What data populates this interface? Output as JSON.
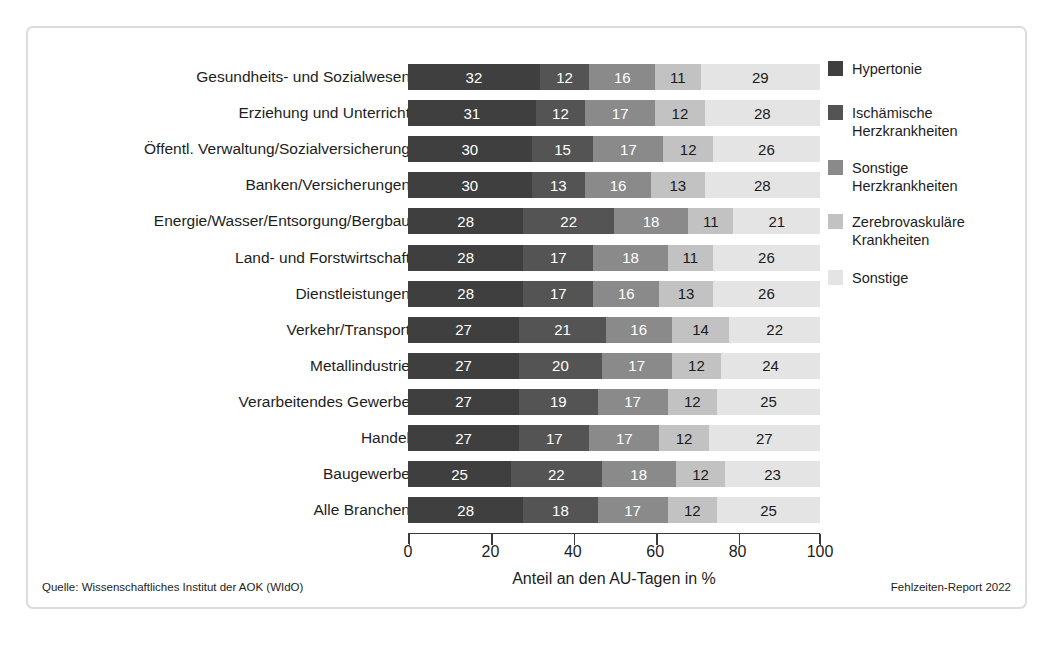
{
  "chart_data": {
    "type": "bar",
    "orientation": "horizontal",
    "stacked": true,
    "title": "",
    "xlabel": "Anteil an den AU-Tagen in %",
    "ylabel": "",
    "xlim": [
      0,
      100
    ],
    "xticks": [
      0,
      20,
      40,
      60,
      80,
      100
    ],
    "grid": false,
    "legend_position": "right",
    "categories": [
      "Gesundheits- und Sozialwesen",
      "Erziehung und Unterricht",
      "Öffentl. Verwaltung/Sozialversicherung",
      "Banken/Versicherungen",
      "Energie/Wasser/Entsorgung/Bergbau",
      "Land- und Forstwirtschaft",
      "Dienstleistungen",
      "Verkehr/Transport",
      "Metallindustrie",
      "Verarbeitendes Gewerbe",
      "Handel",
      "Baugewerbe",
      "Alle Branchen"
    ],
    "series": [
      {
        "name": "Hypertonie",
        "color": "#3f3f3f",
        "label_color": "#ffffff",
        "values": [
          32,
          31,
          30,
          30,
          28,
          28,
          28,
          27,
          27,
          27,
          27,
          25,
          28
        ]
      },
      {
        "name": "Ischämische\nHerzkrankheiten",
        "color": "#545454",
        "label_color": "#ffffff",
        "values": [
          12,
          12,
          15,
          13,
          22,
          17,
          17,
          21,
          20,
          19,
          17,
          22,
          18
        ]
      },
      {
        "name": "Sonstige\nHerzkrankheiten",
        "color": "#8a8a8a",
        "label_color": "#ffffff",
        "values": [
          16,
          17,
          17,
          16,
          18,
          18,
          16,
          16,
          17,
          17,
          17,
          18,
          17
        ]
      },
      {
        "name": "Zerebrovaskuläre\nKrankheiten",
        "color": "#c2c2c2",
        "label_color": "#1a1a1a",
        "values": [
          11,
          12,
          12,
          13,
          11,
          11,
          13,
          14,
          12,
          12,
          12,
          12,
          12
        ]
      },
      {
        "name": "Sonstige",
        "color": "#e4e4e4",
        "label_color": "#1a1a1a",
        "values": [
          29,
          28,
          26,
          28,
          21,
          26,
          26,
          22,
          24,
          25,
          27,
          23,
          25
        ]
      }
    ]
  },
  "footer": {
    "source": "Quelle: Wissenschaftliches Institut der AOK (WIdO)",
    "report": "Fehlzeiten-Report 2022"
  }
}
